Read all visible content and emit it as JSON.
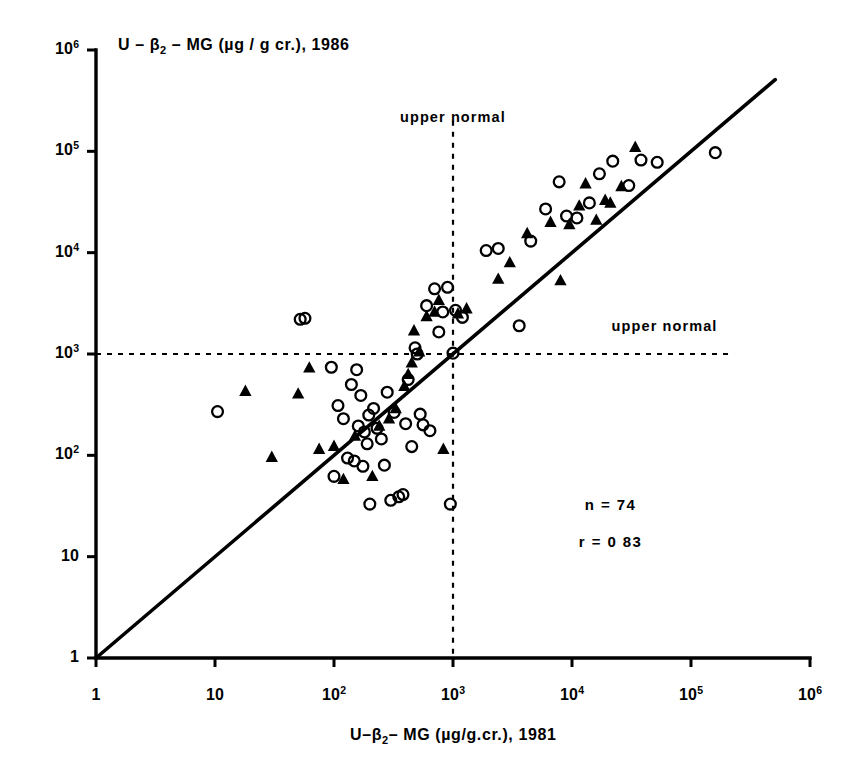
{
  "chart_data": {
    "type": "scatter",
    "title": "",
    "xlabel": "U-β₂- MG (µg/g.cr.), 1981",
    "ylabel": "U – β₂ – MG (µg / g cr.), 1986",
    "xlabel_parts": {
      "pre": "U–",
      "sub": "2",
      "post": "– MG (µg/g.cr.), 1981",
      "beta": "β"
    },
    "ylabel_parts": {
      "pre": "U – ",
      "sub": "2",
      "post": " – MG (µg / g cr.), 1986",
      "beta": "β"
    },
    "xscale": "log",
    "yscale": "log",
    "xlim": [
      1,
      1000000
    ],
    "ylim": [
      1,
      1000000
    ],
    "grid": false,
    "legend_position": "none",
    "x_tick_labels": [
      "1",
      "10",
      "10²",
      "10³",
      "10⁴",
      "10⁵",
      "10⁶"
    ],
    "y_tick_labels": [
      "1",
      "10",
      "10²",
      "10³",
      "10⁴",
      "10⁵",
      "10⁶"
    ],
    "x_tick_exponents": [
      0,
      1,
      2,
      3,
      4,
      5,
      6
    ],
    "y_tick_exponents": [
      0,
      1,
      2,
      3,
      4,
      5,
      6
    ],
    "reference_lines": [
      {
        "name": "identity-line",
        "type": "diagonal",
        "style": "solid",
        "from": [
          1,
          1
        ],
        "to": [
          510000,
          510000
        ]
      },
      {
        "name": "upper-normal-vertical",
        "type": "vertical",
        "style": "dashed",
        "value": 1000,
        "label": "upper  normal",
        "label_pos": [
          1000,
          220000
        ]
      },
      {
        "name": "upper-normal-horizontal",
        "type": "horizontal",
        "style": "dashed",
        "value": 1000,
        "label": "upper  normal",
        "label_pos": [
          60000,
          1900
        ]
      }
    ],
    "annotations": [
      {
        "name": "sample-size",
        "text": "n = 74",
        "x": 21000,
        "y": 33
      },
      {
        "name": "correlation",
        "text": "r = 0 83",
        "x": 21000,
        "y": 14
      }
    ],
    "series": [
      {
        "name": "open-circle",
        "marker": "circle-open",
        "color": "#000000",
        "points": [
          [
            10.5,
            270
          ],
          [
            52,
            2200
          ],
          [
            57,
            2250
          ],
          [
            95,
            740
          ],
          [
            100,
            62
          ],
          [
            108,
            310
          ],
          [
            120,
            230
          ],
          [
            130,
            94
          ],
          [
            140,
            500
          ],
          [
            148,
            88
          ],
          [
            155,
            700
          ],
          [
            160,
            195
          ],
          [
            168,
            390
          ],
          [
            175,
            78
          ],
          [
            180,
            170
          ],
          [
            190,
            130
          ],
          [
            196,
            250
          ],
          [
            200,
            33
          ],
          [
            215,
            290
          ],
          [
            230,
            185
          ],
          [
            250,
            145
          ],
          [
            265,
            80
          ],
          [
            280,
            420
          ],
          [
            300,
            36
          ],
          [
            320,
            265
          ],
          [
            350,
            39
          ],
          [
            380,
            41
          ],
          [
            400,
            205
          ],
          [
            420,
            560
          ],
          [
            450,
            122
          ],
          [
            480,
            1150
          ],
          [
            500,
            1000
          ],
          [
            530,
            255
          ],
          [
            560,
            200
          ],
          [
            600,
            3000
          ],
          [
            640,
            175
          ],
          [
            700,
            4400
          ],
          [
            760,
            1650
          ],
          [
            820,
            2600
          ],
          [
            900,
            4550
          ],
          [
            950,
            33
          ],
          [
            1000,
            1020
          ],
          [
            1050,
            2700
          ],
          [
            1200,
            2300
          ],
          [
            1900,
            10500
          ],
          [
            2400,
            11000
          ],
          [
            3600,
            1900
          ],
          [
            4500,
            13000
          ],
          [
            6000,
            27000
          ],
          [
            7800,
            50000
          ],
          [
            9000,
            23000
          ],
          [
            11000,
            22000
          ],
          [
            14000,
            31000
          ],
          [
            17000,
            60000
          ],
          [
            22000,
            80000
          ],
          [
            30000,
            46000
          ],
          [
            38000,
            82000
          ],
          [
            52000,
            78000
          ],
          [
            160000,
            97000
          ]
        ]
      },
      {
        "name": "filled-triangle",
        "marker": "triangle-filled",
        "color": "#000000",
        "points": [
          [
            18,
            430
          ],
          [
            30,
            96
          ],
          [
            50,
            405
          ],
          [
            62,
            730
          ],
          [
            75,
            115
          ],
          [
            100,
            123
          ],
          [
            120,
            58
          ],
          [
            150,
            155
          ],
          [
            210,
            62
          ],
          [
            240,
            195
          ],
          [
            290,
            230
          ],
          [
            330,
            290
          ],
          [
            390,
            480
          ],
          [
            420,
            630
          ],
          [
            450,
            820
          ],
          [
            470,
            1700
          ],
          [
            520,
            1050
          ],
          [
            600,
            2350
          ],
          [
            700,
            2600
          ],
          [
            760,
            3400
          ],
          [
            830,
            115
          ],
          [
            1100,
            2500
          ],
          [
            1300,
            2800
          ],
          [
            2400,
            5500
          ],
          [
            3000,
            8000
          ],
          [
            4200,
            15500
          ],
          [
            6600,
            20000
          ],
          [
            9500,
            19000
          ],
          [
            11500,
            29000
          ],
          [
            13000,
            48000
          ],
          [
            16000,
            21000
          ],
          [
            19000,
            33000
          ],
          [
            21000,
            31000
          ],
          [
            26000,
            45000
          ],
          [
            34000,
            110000
          ],
          [
            8000,
            5300
          ]
        ]
      }
    ]
  },
  "axis": {
    "x_title_plain": "U-β 2- MG (µg/g.cr.), 1981",
    "y_title_plain": "U - β 2 - MG (µg / g cr.), 1986"
  },
  "labels": {
    "upper_normal_vertical": "upper  normal",
    "upper_normal_horizontal": "upper  normal",
    "n_value": "n = 74",
    "r_value": "r = 0 83"
  },
  "colors": {
    "ink": "#000000",
    "background": "#ffffff"
  }
}
